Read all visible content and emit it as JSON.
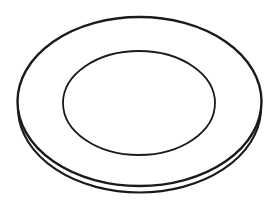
{
  "figure": {
    "background": "#ffffff",
    "stroke_color": "#1a1a1a",
    "outer_rim": {
      "cx": 139.5,
      "cy": 101.5,
      "rx": 122,
      "ry": 84.5,
      "stroke_width": 2.4
    },
    "rim_thickness_edge": {
      "cx": 139.5,
      "cy": 108,
      "rx": 121.5,
      "ry": 84.5,
      "stroke_width": 2.2
    },
    "inner_well": {
      "cx": 139,
      "cy": 103,
      "rx": 76,
      "ry": 52,
      "stroke_width": 1.8
    }
  }
}
